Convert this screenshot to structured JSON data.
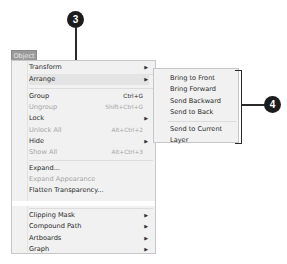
{
  "menubar": {
    "active_menu": "Object"
  },
  "menu": {
    "items": [
      {
        "label": "Transform",
        "shortcut": "",
        "submenu": true,
        "disabled": false
      },
      {
        "label": "Arrange",
        "shortcut": "",
        "submenu": true,
        "disabled": false,
        "highlighted": true
      },
      {
        "label": "Group",
        "shortcut": "Ctrl+G",
        "submenu": false,
        "disabled": false
      },
      {
        "label": "Ungroup",
        "shortcut": "Shift+Ctrl+G",
        "submenu": false,
        "disabled": true
      },
      {
        "label": "Lock",
        "shortcut": "",
        "submenu": true,
        "disabled": false
      },
      {
        "label": "Unlock All",
        "shortcut": "Alt+Ctrl+2",
        "submenu": false,
        "disabled": true
      },
      {
        "label": "Hide",
        "shortcut": "",
        "submenu": true,
        "disabled": false
      },
      {
        "label": "Show All",
        "shortcut": "Alt+Ctrl+3",
        "submenu": false,
        "disabled": true
      },
      {
        "label": "Expand...",
        "shortcut": "",
        "submenu": false,
        "disabled": false
      },
      {
        "label": "Expand Appearance",
        "shortcut": "",
        "submenu": false,
        "disabled": true
      },
      {
        "label": "Flatten Transparency...",
        "shortcut": "",
        "submenu": false,
        "disabled": false
      },
      {
        "label": "Clipping Mask",
        "shortcut": "",
        "submenu": true,
        "disabled": false
      },
      {
        "label": "Compound Path",
        "shortcut": "",
        "submenu": true,
        "disabled": false
      },
      {
        "label": "Artboards",
        "shortcut": "",
        "submenu": true,
        "disabled": false
      },
      {
        "label": "Graph",
        "shortcut": "",
        "submenu": true,
        "disabled": false
      }
    ],
    "submenu_arrow": "▶"
  },
  "arrange_submenu": {
    "items": [
      {
        "label": "Bring to Front"
      },
      {
        "label": "Bring Forward"
      },
      {
        "label": "Send Backward"
      },
      {
        "label": "Send to Back"
      },
      {
        "label": "Send to Current Layer"
      }
    ]
  },
  "callouts": [
    {
      "number": "3"
    },
    {
      "number": "4"
    }
  ]
}
